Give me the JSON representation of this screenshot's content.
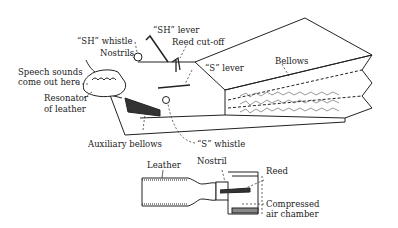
{
  "figure": {
    "type": "technical-illustration",
    "main_labels": {
      "sh_lever": "“SH” lever",
      "sh_whistle": "“SH” whistle",
      "reed_cutoff": "Reed cut-off",
      "nostrils": "Nostrils",
      "s_lever": "“S” lever",
      "bellows": "Bellows",
      "speech_line1": "Speech sounds",
      "speech_line2": "come out here",
      "resonator_line1": "Resonator",
      "resonator_line2": "of leather",
      "auxiliary_bellows": "Auxiliary bellows",
      "s_whistle": "“S” whistle"
    },
    "detail_labels": {
      "leather": "Leather",
      "nostril": "Nostril",
      "reed": "Reed",
      "air_line1": "Compressed",
      "air_line2": "air chamber"
    }
  }
}
